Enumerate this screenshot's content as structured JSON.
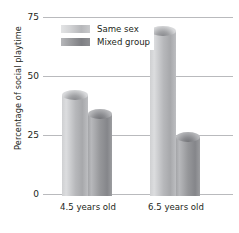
{
  "chart_data": {
    "type": "bar",
    "title": "",
    "xlabel": "",
    "ylabel": "Percentage of social playtime",
    "categories": [
      "4.5 years old",
      "6.5 years old"
    ],
    "series": [
      {
        "name": "Same sex",
        "values": [
          45,
          72
        ],
        "color": "#c9cacc"
      },
      {
        "name": "Mixed group",
        "values": [
          37,
          27
        ],
        "color": "#96979a"
      }
    ],
    "ylim": [
      0,
      75
    ],
    "yticks": [
      0,
      25,
      50,
      75
    ],
    "ytick_labels": [
      "0",
      "25",
      "50",
      "75"
    ],
    "grid": true,
    "legend_position": "top-left-inside"
  },
  "axis": {
    "y_title": "Percentage of social playtime",
    "tick_75": "75",
    "tick_50": "50",
    "tick_25": "25",
    "tick_0": "0"
  },
  "legend": {
    "item_1": "Same sex",
    "item_2": "Mixed group"
  },
  "categories": {
    "cat_1": "4.5 years old",
    "cat_2": "6.5 years old"
  }
}
